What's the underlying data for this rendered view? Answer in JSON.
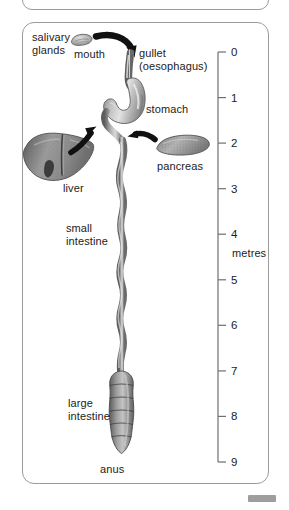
{
  "figure": {
    "scale_unit_label": "metres",
    "scale_ticks": [
      "0",
      "1",
      "2",
      "3",
      "4",
      "5",
      "6",
      "7",
      "8",
      "9"
    ],
    "scale_range": [
      0,
      9
    ],
    "scale_axis_x": 218,
    "scale_top_y": 52,
    "scale_bottom_y": 462
  },
  "labels": {
    "salivary_glands": "salivary\nglands",
    "mouth": "mouth",
    "gullet": "gullet\n(oesophagus)",
    "stomach": "stomach",
    "liver": "liver",
    "pancreas": "pancreas",
    "small_intestine": "small\nintestine",
    "large_intestine": "large\nintestine",
    "anus": "anus",
    "metres": "metres"
  },
  "colors": {
    "card_border": "#9b9b9b",
    "organ_mid": "#8d8d8d",
    "organ_light": "#d8d8d8",
    "organ_dark": "#5f5f5f",
    "arrow": "#111111",
    "text": "#1c1c1c",
    "scale_line": "#6f6f6f",
    "chip": "#9e9e9e"
  },
  "organs": [
    {
      "name": "salivary-glands",
      "label_key": "salivary_glands"
    },
    {
      "name": "mouth",
      "label_key": "mouth"
    },
    {
      "name": "gullet-oesophagus",
      "label_key": "gullet"
    },
    {
      "name": "stomach",
      "label_key": "stomach"
    },
    {
      "name": "liver",
      "label_key": "liver"
    },
    {
      "name": "pancreas",
      "label_key": "pancreas"
    },
    {
      "name": "small-intestine",
      "label_key": "small_intestine"
    },
    {
      "name": "large-intestine",
      "label_key": "large_intestine"
    },
    {
      "name": "anus",
      "label_key": "anus"
    }
  ]
}
